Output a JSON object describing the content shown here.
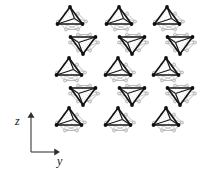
{
  "figure": {
    "kind": "crystal-structure-projection",
    "background_color": "#ffffff",
    "polyhedra": {
      "tetrahedron": {
        "edge_color": "#151515",
        "fill_color": "#ffffff",
        "stipple_color": "#9a9a9a",
        "vertex_color": "#101010",
        "edge_width": 1.6,
        "count": 15
      },
      "octahedron": {
        "edge_color": "#a8a8a8",
        "fill_color": "#ffffff",
        "vertex_color": "#c0c0c0",
        "vertex_ring_color": "#9a9a9a",
        "edge_width": 0.8,
        "count": 15
      }
    },
    "chains": {
      "count": 3,
      "centers_x": [
        78,
        128,
        176
      ],
      "units_per_chain": 5,
      "unit_spacing_y": 25.5,
      "top_unit_y": 20
    }
  },
  "axes": {
    "origin": {
      "x": 31,
      "y": 152
    },
    "vertical": {
      "label": "z",
      "label_x": 17,
      "label_y": 121,
      "length": 38,
      "arrow": "up-arrow-icon"
    },
    "horizontal": {
      "label": "y",
      "label_x": 59,
      "label_y": 161,
      "length": 27,
      "arrow": "right-arrow-icon"
    },
    "line_color": "#3a3a3a",
    "line_width": 1.1,
    "label_color": "#141414",
    "label_font_size": 12
  }
}
